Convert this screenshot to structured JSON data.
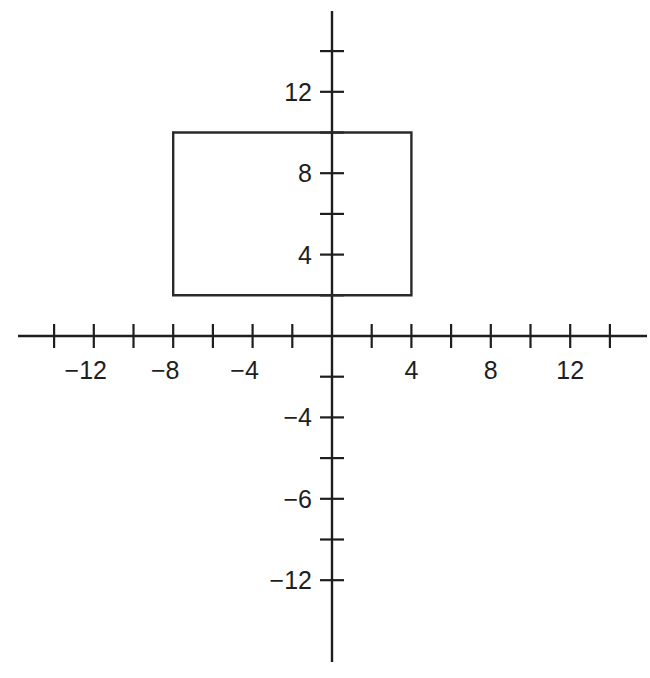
{
  "chart_data": {
    "type": "diagram",
    "title": "",
    "x_axis": {
      "range": [
        -15,
        15
      ],
      "tick_step": 2,
      "ticks": [
        -14,
        -12,
        -10,
        -8,
        -6,
        -4,
        -2,
        2,
        4,
        6,
        8,
        10,
        12,
        14
      ],
      "labels": [
        {
          "value": -12,
          "text": "−12"
        },
        {
          "value": -8,
          "text": "−8"
        },
        {
          "value": -4,
          "text": "−4"
        },
        {
          "value": 4,
          "text": "4"
        },
        {
          "value": 8,
          "text": "8"
        },
        {
          "value": 12,
          "text": "12"
        }
      ]
    },
    "y_axis": {
      "range": [
        -16,
        16
      ],
      "tick_step": 2,
      "ticks": [
        14,
        12,
        10,
        8,
        6,
        4,
        2,
        -2,
        -4,
        -6,
        -8,
        -10,
        -12
      ],
      "labels": [
        {
          "value": 12,
          "text": "12"
        },
        {
          "value": 8,
          "text": "8"
        },
        {
          "value": 4,
          "text": "4"
        },
        {
          "value": -4,
          "text": "−4"
        },
        {
          "value": -8,
          "text": "−6"
        },
        {
          "value": -12,
          "text": "−12"
        }
      ]
    },
    "shapes": [
      {
        "type": "rectangle",
        "vertices": [
          [
            -8,
            2
          ],
          [
            4,
            2
          ],
          [
            4,
            10
          ],
          [
            -8,
            10
          ]
        ]
      }
    ],
    "grid": false
  },
  "layout": {
    "origin_px": [
      332,
      336
    ],
    "unit_x_px": 19.85,
    "unit_y_px": 20.35,
    "x_axis_extent_px": [
      18,
      647
    ],
    "y_axis_extent_px": [
      11,
      662
    ],
    "tick_half_px": 12
  }
}
